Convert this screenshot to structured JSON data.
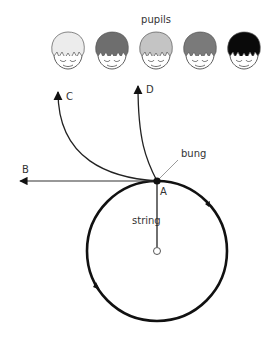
{
  "title": "pupils",
  "labels": {
    "A": "A",
    "B": "B",
    "C": "C",
    "D": "D",
    "bung": "bung",
    "string": "string"
  },
  "pupils": [
    {
      "hair_color": "#ececec"
    },
    {
      "hair_color": "#6e6e6e"
    },
    {
      "hair_color": "#c4c4c4"
    },
    {
      "hair_color": "#7a7a7a"
    },
    {
      "hair_color": "#0a0a0a"
    }
  ],
  "geometry": {
    "circle_center": [
      157,
      251
    ],
    "circle_radius": 70,
    "point_A": [
      157,
      181
    ]
  }
}
